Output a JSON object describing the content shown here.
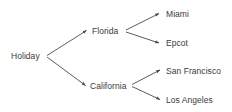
{
  "diagram": {
    "type": "tree",
    "background_color": "#ffffff",
    "line_color": "#4a4a4a",
    "text_color": "#3a3a3a",
    "nodes": {
      "root": {
        "label": "Holiday",
        "level": 0
      },
      "florida": {
        "label": "Florida",
        "level": 1
      },
      "california": {
        "label": "California",
        "level": 1
      },
      "miami": {
        "label": "Miami",
        "level": 2
      },
      "epcot": {
        "label": "Epcot",
        "level": 2
      },
      "san_francisco": {
        "label": "San Francisco",
        "level": 2
      },
      "los_angeles": {
        "label": "Los Angeles",
        "level": 2
      }
    },
    "edges": [
      {
        "from": "root",
        "to": "florida"
      },
      {
        "from": "root",
        "to": "california"
      },
      {
        "from": "florida",
        "to": "miami"
      },
      {
        "from": "florida",
        "to": "epcot"
      },
      {
        "from": "california",
        "to": "san_francisco"
      },
      {
        "from": "california",
        "to": "los_angeles"
      }
    ]
  }
}
